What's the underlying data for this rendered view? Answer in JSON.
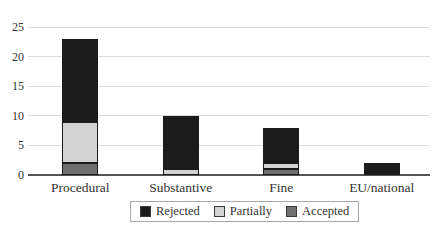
{
  "chart_data": {
    "type": "bar",
    "stacked": true,
    "title": "",
    "xlabel": "",
    "ylabel": "",
    "categories": [
      "Procedural",
      "Substantive",
      "Fine",
      "EU/national"
    ],
    "series": [
      {
        "name": "Accepted",
        "color": "#6f6f6f",
        "values": [
          2,
          0,
          1,
          0
        ]
      },
      {
        "name": "Partially",
        "color": "#d3d3d3",
        "values": [
          7,
          1,
          1,
          0
        ]
      },
      {
        "name": "Rejected",
        "color": "#1b1b1b",
        "values": [
          14,
          9,
          6,
          2
        ]
      }
    ],
    "stack_totals": [
      23,
      10,
      8,
      2
    ],
    "ylim": [
      0,
      25
    ],
    "ytick_step": 5,
    "ytick_labels": [
      "0",
      "5",
      "10",
      "15",
      "20",
      "25"
    ],
    "grid": true,
    "legend_position": "bottom",
    "legend_order": [
      "Rejected",
      "Partially",
      "Accepted"
    ]
  },
  "colors": {
    "gridline": "#dcdcdc",
    "axis": "#555555",
    "text": "#333333",
    "background": "#ffffff",
    "legend_border": "#a8a8a8"
  }
}
